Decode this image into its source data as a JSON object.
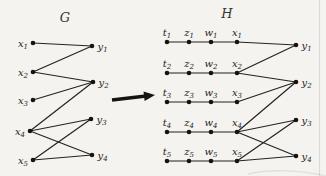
{
  "figure": {
    "background": "#f4f3ef",
    "ink": "#26231f"
  },
  "graphs": [
    {
      "id": "G",
      "title": "G",
      "nodes": [
        {
          "id": "x1",
          "base": "x",
          "sub": "1",
          "x": 33,
          "y": 43,
          "side": "left"
        },
        {
          "id": "x2",
          "base": "x",
          "sub": "2",
          "x": 33,
          "y": 72,
          "side": "left"
        },
        {
          "id": "x3",
          "base": "x",
          "sub": "3",
          "x": 33,
          "y": 100,
          "side": "left"
        },
        {
          "id": "x4",
          "base": "x",
          "sub": "4",
          "x": 30,
          "y": 131,
          "side": "left"
        },
        {
          "id": "x5",
          "base": "x",
          "sub": "5",
          "x": 33,
          "y": 160,
          "side": "left"
        },
        {
          "id": "y1",
          "base": "y",
          "sub": "1",
          "x": 92,
          "y": 46,
          "side": "right"
        },
        {
          "id": "y2",
          "base": "y",
          "sub": "2",
          "x": 93,
          "y": 82,
          "side": "right"
        },
        {
          "id": "y3",
          "base": "y",
          "sub": "3",
          "x": 91,
          "y": 119,
          "side": "right"
        },
        {
          "id": "y4",
          "base": "y",
          "sub": "4",
          "x": 92,
          "y": 155,
          "side": "right"
        }
      ],
      "edges": [
        [
          "x1",
          "y1"
        ],
        [
          "x2",
          "y1"
        ],
        [
          "x2",
          "y2"
        ],
        [
          "x3",
          "y2"
        ],
        [
          "x4",
          "y2"
        ],
        [
          "x4",
          "y3"
        ],
        [
          "x4",
          "y4"
        ],
        [
          "x5",
          "y3"
        ],
        [
          "x5",
          "y4"
        ]
      ]
    },
    {
      "id": "H",
      "title": "H",
      "nodes": [
        {
          "id": "t1",
          "base": "t",
          "sub": "1",
          "x": 167,
          "y": 42,
          "side": "top"
        },
        {
          "id": "z1",
          "base": "z",
          "sub": "1",
          "x": 189,
          "y": 42,
          "side": "top"
        },
        {
          "id": "w1",
          "base": "w",
          "sub": "1",
          "x": 211,
          "y": 42,
          "side": "top"
        },
        {
          "id": "x1",
          "base": "x",
          "sub": "1",
          "x": 237,
          "y": 42,
          "side": "top"
        },
        {
          "id": "t2",
          "base": "t",
          "sub": "2",
          "x": 167,
          "y": 73,
          "side": "top"
        },
        {
          "id": "z2",
          "base": "z",
          "sub": "2",
          "x": 189,
          "y": 73,
          "side": "top"
        },
        {
          "id": "w2",
          "base": "w",
          "sub": "2",
          "x": 211,
          "y": 73,
          "side": "top"
        },
        {
          "id": "x2",
          "base": "x",
          "sub": "2",
          "x": 237,
          "y": 73,
          "side": "top"
        },
        {
          "id": "t3",
          "base": "t",
          "sub": "3",
          "x": 167,
          "y": 102,
          "side": "top"
        },
        {
          "id": "z3",
          "base": "z",
          "sub": "3",
          "x": 189,
          "y": 102,
          "side": "top"
        },
        {
          "id": "w3",
          "base": "w",
          "sub": "3",
          "x": 211,
          "y": 102,
          "side": "top"
        },
        {
          "id": "x3",
          "base": "x",
          "sub": "3",
          "x": 237,
          "y": 102,
          "side": "top"
        },
        {
          "id": "t4",
          "base": "t",
          "sub": "4",
          "x": 167,
          "y": 132,
          "side": "top"
        },
        {
          "id": "z4",
          "base": "z",
          "sub": "4",
          "x": 189,
          "y": 132,
          "side": "top"
        },
        {
          "id": "w4",
          "base": "w",
          "sub": "4",
          "x": 211,
          "y": 132,
          "side": "top"
        },
        {
          "id": "x4",
          "base": "x",
          "sub": "4",
          "x": 237,
          "y": 132,
          "side": "top"
        },
        {
          "id": "t5",
          "base": "t",
          "sub": "5",
          "x": 167,
          "y": 161,
          "side": "top"
        },
        {
          "id": "z5",
          "base": "z",
          "sub": "5",
          "x": 189,
          "y": 161,
          "side": "top"
        },
        {
          "id": "w5",
          "base": "w",
          "sub": "5",
          "x": 211,
          "y": 161,
          "side": "top"
        },
        {
          "id": "x5",
          "base": "x",
          "sub": "5",
          "x": 237,
          "y": 161,
          "side": "top"
        },
        {
          "id": "y1",
          "base": "y",
          "sub": "1",
          "x": 296,
          "y": 45,
          "side": "right"
        },
        {
          "id": "y2",
          "base": "y",
          "sub": "2",
          "x": 296,
          "y": 82,
          "side": "right"
        },
        {
          "id": "y3",
          "base": "y",
          "sub": "3",
          "x": 296,
          "y": 120,
          "side": "right"
        },
        {
          "id": "y4",
          "base": "y",
          "sub": "4",
          "x": 296,
          "y": 156,
          "side": "right"
        }
      ],
      "edges": [
        [
          "t1",
          "z1"
        ],
        [
          "z1",
          "w1"
        ],
        [
          "w1",
          "x1"
        ],
        [
          "x1",
          "y1"
        ],
        [
          "t2",
          "z2"
        ],
        [
          "z2",
          "w2"
        ],
        [
          "w2",
          "x2"
        ],
        [
          "x2",
          "y1"
        ],
        [
          "x2",
          "y2"
        ],
        [
          "t3",
          "z3"
        ],
        [
          "z3",
          "w3"
        ],
        [
          "w3",
          "x3"
        ],
        [
          "x3",
          "y2"
        ],
        [
          "t4",
          "z4"
        ],
        [
          "z4",
          "w4"
        ],
        [
          "w4",
          "x4"
        ],
        [
          "x4",
          "y2"
        ],
        [
          "x4",
          "y3"
        ],
        [
          "x4",
          "y4"
        ],
        [
          "t5",
          "z5"
        ],
        [
          "z5",
          "w5"
        ],
        [
          "w5",
          "x5"
        ],
        [
          "x5",
          "y3"
        ],
        [
          "x5",
          "y4"
        ]
      ]
    }
  ],
  "arrow": {
    "from": {
      "x": 112,
      "y": 100
    },
    "to": {
      "x": 155,
      "y": 95
    }
  }
}
